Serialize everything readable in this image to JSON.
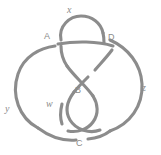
{
  "figure": {
    "kind": "knot-diagram",
    "background_color": "#ffffff",
    "stroke_color": "#8c8c8c",
    "label_color": "#8a8a8a",
    "width": 161,
    "height": 155
  },
  "labels": [
    {
      "id": "x",
      "text": "x",
      "style": "italic",
      "x": 67,
      "y": 5
    },
    {
      "id": "A",
      "text": "A",
      "style": "upright",
      "x": 44,
      "y": 32
    },
    {
      "id": "D",
      "text": "D",
      "style": "upright",
      "x": 108,
      "y": 33
    },
    {
      "id": "B",
      "text": "B",
      "style": "upright",
      "x": 75,
      "y": 86
    },
    {
      "id": "w",
      "text": "w",
      "style": "italic",
      "x": 46,
      "y": 99
    },
    {
      "id": "z",
      "text": "z",
      "style": "italic",
      "x": 142,
      "y": 83
    },
    {
      "id": "y",
      "text": "y",
      "style": "italic",
      "x": 5,
      "y": 104
    },
    {
      "id": "C",
      "text": "C",
      "style": "upright",
      "x": 76,
      "y": 139
    }
  ],
  "strands": [
    {
      "id": "top-loop-left",
      "description": "upper loop left side descending through A crossing",
      "d": "M 61 40 C 58 26 70 16 81 16 C 92 16 101 23 103 33"
    },
    {
      "id": "top-loop-right-upper",
      "description": "upper loop right side ending above D undercrossing",
      "d": "M 103 33 C 104 37 104 40 104 43"
    },
    {
      "id": "top-loop-left-descend",
      "description": "left side of top loop continuing below A crossing toward center",
      "d": "M 61 46 C 61 54 63 60 67 66"
    },
    {
      "id": "horizontal-over-strand",
      "description": "long strand crossing over the top loop from A toward right side",
      "d": "M 58 44 C 75 41 98 41 113 46"
    },
    {
      "id": "left-arc",
      "description": "large left arc from A down around the left side to bottom",
      "d": "M 55 46 C 40 48 24 56 18 74 C 11 95 19 118 38 128"
    },
    {
      "id": "right-arc",
      "description": "large right arc from D sweeping down the right side to the bottom",
      "d": "M 110 40 C 128 48 141 64 142 84 C 143 106 130 124 110 131"
    },
    {
      "id": "center-cross-a",
      "description": "center crossing strand going from upper-left to lower-right",
      "d": "M 67 66 C 74 76 86 86 93 96"
    },
    {
      "id": "center-cross-b-upper",
      "description": "center crossing strand upper-right segment",
      "d": "M 112 50 C 106 58 100 64 95 70"
    },
    {
      "id": "center-cross-b-lower",
      "description": "center crossing strand lower-left segment, ends at B gap",
      "d": "M 88 77 C 83 82 78 87 74 92"
    },
    {
      "id": "inner-left-loop",
      "description": "inner lobe curving left and down from center to bottom",
      "d": "M 74 92 C 68 100 64 110 70 120 C 76 130 90 134 100 130"
    },
    {
      "id": "inner-right-loop",
      "description": "inner lobe curving right and down, passing near B",
      "d": "M 93 96 C 98 104 99 114 93 122 C 88 129 78 133 68 131"
    },
    {
      "id": "w-strand-end",
      "description": "short strand terminating near w label (undercrossing gap)",
      "d": "M 62 104 C 60 112 60 118 62 124"
    },
    {
      "id": "bottom-left-arc",
      "description": "bottom arc from left side toward C",
      "d": "M 38 128 C 50 137 64 141 76 140"
    },
    {
      "id": "bottom-right-arc",
      "description": "bottom arc from C toward right side",
      "d": "M 88 139 C 98 138 105 135 110 131"
    }
  ]
}
